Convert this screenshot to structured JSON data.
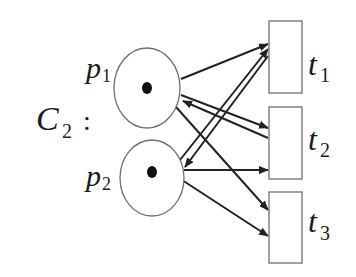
{
  "net": {
    "name": "C",
    "name_subscript": "2",
    "separator": ":"
  },
  "places": [
    {
      "id": "p1",
      "label": "p",
      "subscript": "1",
      "tokens": 1
    },
    {
      "id": "p2",
      "label": "p",
      "subscript": "2",
      "tokens": 1
    }
  ],
  "transitions": [
    {
      "id": "t1",
      "label": "t",
      "subscript": "1"
    },
    {
      "id": "t2",
      "label": "t",
      "subscript": "2"
    },
    {
      "id": "t3",
      "label": "t",
      "subscript": "3"
    }
  ],
  "arcs": [
    {
      "from": "p1",
      "to": "t1"
    },
    {
      "from": "p1",
      "to": "t2"
    },
    {
      "from": "t2",
      "to": "p1"
    },
    {
      "from": "p1",
      "to": "t3"
    },
    {
      "from": "p2",
      "to": "t1"
    },
    {
      "from": "t1",
      "to": "p2"
    },
    {
      "from": "p2",
      "to": "t2"
    },
    {
      "from": "p2",
      "to": "t3"
    }
  ],
  "colors": {
    "outline": "#707070",
    "arc": "#222222",
    "token": "#111111",
    "background": "#ffffff"
  }
}
